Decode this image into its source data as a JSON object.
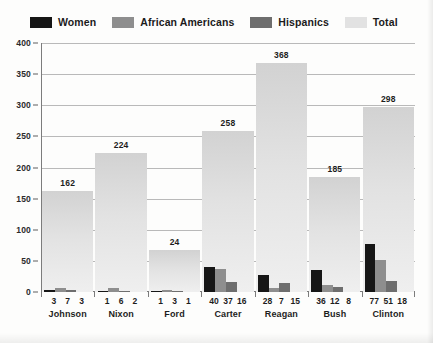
{
  "legend": {
    "items": [
      {
        "label": "Women",
        "color": "#161616",
        "key": "women"
      },
      {
        "label": "African Americans",
        "color": "#8e8e8e",
        "key": "african_americans"
      },
      {
        "label": "Hispanics",
        "color": "#6e6e6e",
        "key": "hispanics"
      },
      {
        "label": "Total",
        "color": "#e2e2e2",
        "key": "total"
      }
    ]
  },
  "chart_data": {
    "type": "bar",
    "title": "",
    "xlabel": "",
    "ylabel": "",
    "ylim": [
      0,
      400
    ],
    "yticks": [
      0,
      50,
      100,
      150,
      200,
      250,
      300,
      350,
      400
    ],
    "ytick_labels": [
      "0",
      "50",
      "100",
      "150",
      "200",
      "250",
      "300",
      "350",
      "400"
    ],
    "grid": true,
    "legend_position": "top-left",
    "categories": [
      "Johnson",
      "Nixon",
      "Ford",
      "Carter",
      "Reagan",
      "Bush",
      "Clinton"
    ],
    "series": [
      {
        "name": "Women",
        "color": "#161616",
        "values": [
          3,
          1,
          1,
          40,
          28,
          36,
          77
        ]
      },
      {
        "name": "African Americans",
        "color": "#8e8e8e",
        "values": [
          7,
          6,
          3,
          37,
          7,
          12,
          51
        ]
      },
      {
        "name": "Hispanics",
        "color": "#6e6e6e",
        "values": [
          3,
          2,
          1,
          16,
          15,
          8,
          18
        ]
      },
      {
        "name": "Total",
        "color": "#e2e2e2",
        "values": [
          162,
          224,
          67,
          258,
          368,
          185,
          298
        ]
      }
    ],
    "total_labels": [
      "162",
      "224",
      "24",
      "258",
      "368",
      "185",
      "298"
    ]
  },
  "groups": [
    {
      "name": "Johnson",
      "women": "3",
      "african_americans": "7",
      "hispanics": "3",
      "total_label": "162",
      "total_value": 162
    },
    {
      "name": "Nixon",
      "women": "1",
      "african_americans": "6",
      "hispanics": "2",
      "total_label": "224",
      "total_value": 224
    },
    {
      "name": "Ford",
      "women": "1",
      "african_americans": "3",
      "hispanics": "1",
      "total_label": "24",
      "total_value": 67
    },
    {
      "name": "Carter",
      "women": "40",
      "african_americans": "37",
      "hispanics": "16",
      "total_label": "258",
      "total_value": 258
    },
    {
      "name": "Reagan",
      "women": "28",
      "african_americans": "7",
      "hispanics": "15",
      "total_label": "368",
      "total_value": 368
    },
    {
      "name": "Bush",
      "women": "36",
      "african_americans": "12",
      "hispanics": "8",
      "total_label": "185",
      "total_value": 185
    },
    {
      "name": "Clinton",
      "women": "77",
      "african_americans": "51",
      "hispanics": "18",
      "total_label": "298",
      "total_value": 298
    }
  ]
}
